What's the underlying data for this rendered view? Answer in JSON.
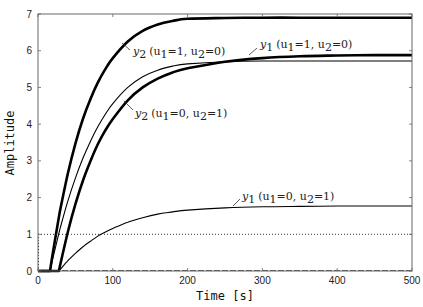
{
  "chart_data": {
    "type": "line",
    "title": "",
    "xlabel": "Time [s]",
    "ylabel": "Amplitude",
    "xlim": [
      0,
      500
    ],
    "ylim": [
      0,
      7
    ],
    "xticks": [
      0,
      100,
      200,
      300,
      400,
      500
    ],
    "yticks": [
      0,
      1,
      2,
      3,
      4,
      5,
      6,
      7
    ],
    "grid": false,
    "legend": "none (inline annotations)",
    "x": [
      0,
      10,
      16,
      20,
      28,
      30,
      40,
      50,
      60,
      70,
      80,
      90,
      100,
      120,
      140,
      160,
      180,
      200,
      250,
      300,
      350,
      400,
      450,
      500
    ],
    "series": [
      {
        "name": "y2 (u1=1, u2=0)",
        "style": "thick",
        "values": [
          0,
          0,
          0,
          0.52,
          1.47,
          1.69,
          2.66,
          3.47,
          4.14,
          4.68,
          5.13,
          5.5,
          5.8,
          6.25,
          6.54,
          6.71,
          6.81,
          6.87,
          6.89,
          6.9,
          6.9,
          6.9,
          6.9,
          6.9
        ]
      },
      {
        "name": "y1 (u1=1, u2=0)",
        "style": "thick",
        "values": [
          0,
          0,
          0,
          0,
          0,
          0.19,
          1.07,
          1.82,
          2.46,
          2.99,
          3.45,
          3.83,
          4.14,
          4.65,
          5.0,
          5.24,
          5.41,
          5.52,
          5.7,
          5.8,
          5.85,
          5.87,
          5.88,
          5.88
        ]
      },
      {
        "name": "y2 (u1=0, u2=1)",
        "style": "thin",
        "values": [
          0,
          0,
          0,
          0.36,
          1.03,
          1.19,
          1.91,
          2.53,
          3.07,
          3.53,
          3.93,
          4.27,
          4.56,
          5.0,
          5.29,
          5.47,
          5.58,
          5.64,
          5.7,
          5.72,
          5.72,
          5.72,
          5.72,
          5.72
        ]
      },
      {
        "name": "y1 (u1=0, u2=1)",
        "style": "thin",
        "values": [
          0,
          0,
          0,
          0,
          0,
          0.05,
          0.28,
          0.48,
          0.66,
          0.81,
          0.95,
          1.06,
          1.16,
          1.33,
          1.45,
          1.55,
          1.61,
          1.66,
          1.72,
          1.75,
          1.76,
          1.77,
          1.77,
          1.77
        ]
      },
      {
        "name": "input step",
        "style": "dotted",
        "values": [
          1,
          1,
          1,
          1,
          1,
          1,
          1,
          1,
          1,
          1,
          1,
          1,
          1,
          1,
          1,
          1,
          1,
          1,
          1,
          1,
          1,
          1,
          1,
          1
        ]
      }
    ],
    "annotations": [
      {
        "text": "y2 (u1=1, u2=0)",
        "at": [
          42,
          6.1
        ]
      },
      {
        "text": "y1 (u1=1, u2=0)",
        "at": [
          280,
          5.88
        ]
      },
      {
        "text": "y2 (u1=0, u2=1)",
        "at": [
          75,
          4.45
        ]
      },
      {
        "text": "y1 (u1=0, u2=1)",
        "at": [
          275,
          1.75
        ]
      }
    ]
  },
  "labels": {
    "xlabel": "Time [s]",
    "ylabel": "Amplitude",
    "xtick_labels": [
      "0",
      "100",
      "200",
      "300",
      "400",
      "500"
    ],
    "ytick_labels": [
      "0",
      "1",
      "2",
      "3",
      "4",
      "5",
      "6",
      "7"
    ],
    "annot_y2_u1": {
      "var": "y",
      "sub": "2",
      "cond": "(u",
      "a": "1",
      "b": "=1, u",
      "c": "2",
      "d": "=0)"
    },
    "annot_y1_u1": {
      "var": "y",
      "sub": "1",
      "cond": "(u",
      "a": "1",
      "b": "=1, u",
      "c": "2",
      "d": "=0)"
    },
    "annot_y2_u2": {
      "var": "y",
      "sub": "2",
      "cond": "(u",
      "a": "1",
      "b": "=0, u",
      "c": "2",
      "d": "=1)"
    },
    "annot_y1_u2": {
      "var": "y",
      "sub": "1",
      "cond": "(u",
      "a": "1",
      "b": "=0, u",
      "c": "2",
      "d": "=1)"
    }
  },
  "colors": {
    "line": "#000000",
    "axis": "#555555",
    "background": "#ffffff"
  }
}
